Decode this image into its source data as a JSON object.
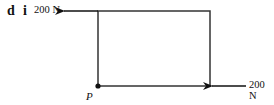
{
  "question": {
    "part": "d",
    "subpart": "i"
  },
  "diagram": {
    "shape": "rectangle",
    "point_label": "P",
    "forces": [
      {
        "position": "top-left corner",
        "direction": "left",
        "magnitude": "200 N"
      },
      {
        "position": "bottom-right corner",
        "direction": "left",
        "magnitude": "200 N"
      }
    ],
    "colors": {
      "line": "#111111",
      "background": "#ffffff"
    }
  }
}
